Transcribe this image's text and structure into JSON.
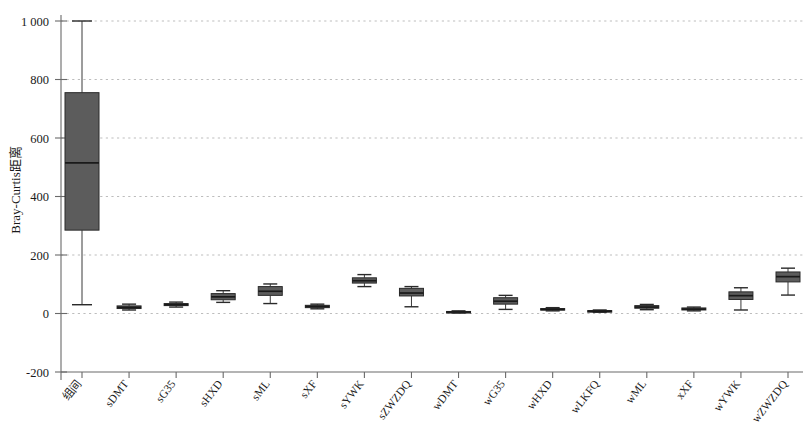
{
  "chart_data": {
    "type": "box",
    "title": "",
    "xlabel": "",
    "ylabel": "Bray-Curtis距离",
    "ylim": [
      -200,
      1060
    ],
    "yticks": [
      -200,
      0,
      200,
      400,
      600,
      800,
      1000
    ],
    "ytick_labels": [
      "-200",
      "0",
      "200",
      "400",
      "600",
      "800",
      "1 000"
    ],
    "grid": "horizontal-dashed",
    "legend": "none",
    "categories": [
      "组间",
      "sDMT",
      "sG35",
      "sHXD",
      "sML",
      "sXF",
      "sYWK",
      "sZWZDQ",
      "wDMT",
      "wG35",
      "wHXD",
      "wLKFQ",
      "wML",
      "xXF",
      "wYWK",
      "wZWZDQ"
    ],
    "boxes": [
      {
        "label": "组间",
        "whisker_low": 30,
        "q1": 285,
        "median": 515,
        "q3": 755,
        "whisker_high": 1000
      },
      {
        "label": "sDMT",
        "whisker_low": 12,
        "q1": 17,
        "median": 21,
        "q3": 26,
        "whisker_high": 32
      },
      {
        "label": "sG35",
        "whisker_low": 22,
        "q1": 27,
        "median": 30,
        "q3": 34,
        "whisker_high": 39
      },
      {
        "label": "sHXD",
        "whisker_low": 38,
        "q1": 47,
        "median": 57,
        "q3": 68,
        "whisker_high": 78
      },
      {
        "label": "sML",
        "whisker_low": 34,
        "q1": 62,
        "median": 76,
        "q3": 92,
        "whisker_high": 101
      },
      {
        "label": "sXF",
        "whisker_low": 16,
        "q1": 20,
        "median": 24,
        "q3": 28,
        "whisker_high": 32
      },
      {
        "label": "sYWK",
        "whisker_low": 92,
        "q1": 104,
        "median": 112,
        "q3": 122,
        "whisker_high": 133
      },
      {
        "label": "sZWZDQ",
        "whisker_low": 23,
        "q1": 60,
        "median": 70,
        "q3": 86,
        "whisker_high": 92
      },
      {
        "label": "wDMT",
        "whisker_low": 2,
        "q1": 4,
        "median": 5,
        "q3": 7,
        "whisker_high": 9
      },
      {
        "label": "wG35",
        "whisker_low": 14,
        "q1": 32,
        "median": 42,
        "q3": 54,
        "whisker_high": 62
      },
      {
        "label": "wHXD",
        "whisker_low": 9,
        "q1": 12,
        "median": 14,
        "q3": 17,
        "whisker_high": 20
      },
      {
        "label": "wLKFQ",
        "whisker_low": 4,
        "q1": 6,
        "median": 8,
        "q3": 10,
        "whisker_high": 12
      },
      {
        "label": "wML",
        "whisker_low": 13,
        "q1": 18,
        "median": 22,
        "q3": 27,
        "whisker_high": 31
      },
      {
        "label": "xXF",
        "whisker_low": 9,
        "q1": 12,
        "median": 15,
        "q3": 19,
        "whisker_high": 22
      },
      {
        "label": "wYWK",
        "whisker_low": 12,
        "q1": 48,
        "median": 61,
        "q3": 74,
        "whisker_high": 88
      },
      {
        "label": "wZWZDQ",
        "whisker_low": 63,
        "q1": 108,
        "median": 126,
        "q3": 142,
        "whisker_high": 155
      }
    ]
  },
  "style": {
    "box_fill": "#5c5c5c",
    "box_stroke": "#2a2a2a",
    "axis_color": "#6a6a6a",
    "grid_color": "#bdbdbd",
    "background": "#ffffff"
  }
}
